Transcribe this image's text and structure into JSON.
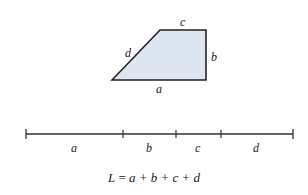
{
  "diagram": {
    "shape": {
      "type": "trapezoid",
      "fill": "#dde6f0",
      "stroke": "#222222",
      "vertices": [
        [
          112,
          80
        ],
        [
          160,
          30
        ],
        [
          206,
          30
        ],
        [
          206,
          80
        ]
      ],
      "side_labels": {
        "a": "a",
        "b": "b",
        "c": "c",
        "d": "d"
      }
    },
    "number_line": {
      "y": 134,
      "ticks": [
        26,
        123,
        176,
        221,
        293
      ],
      "segment_labels": [
        "a",
        "b",
        "c",
        "d"
      ]
    },
    "formula": {
      "lhs": "L",
      "rhs": "a + b + c + d",
      "text": "L = a + b + c + d"
    }
  }
}
